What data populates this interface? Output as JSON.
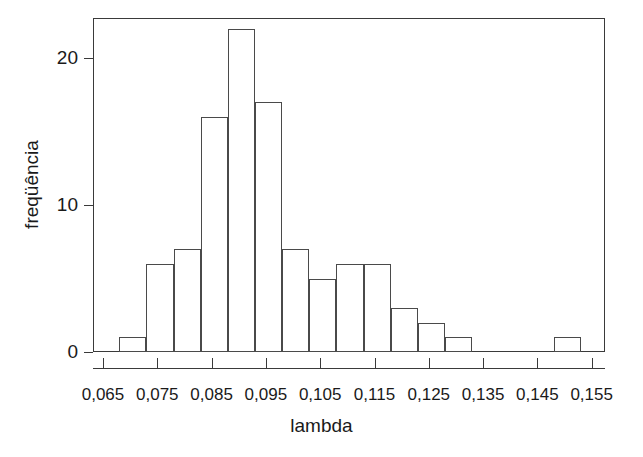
{
  "chart_data": {
    "type": "bar",
    "title": "",
    "subtitle": "",
    "xlabel": "lambda",
    "ylabel": "freqüência",
    "xlim": [
      0.065,
      0.155
    ],
    "ylim": [
      0,
      22
    ],
    "grid": false,
    "legend": "none",
    "bin_width": 0.005,
    "x_tick_labels": [
      "0,065",
      "0,075",
      "0,085",
      "0,095",
      "0,105",
      "0,115",
      "0,125",
      "0,135",
      "0,145",
      "0,155"
    ],
    "x_tick_values": [
      0.065,
      0.075,
      0.085,
      0.095,
      0.105,
      0.115,
      0.125,
      0.135,
      0.145,
      0.155
    ],
    "y_tick_labels": [
      "0",
      "10",
      "20"
    ],
    "y_tick_values": [
      0,
      10,
      20
    ],
    "categories": [
      "0,068-0,073",
      "0,073-0,078",
      "0,078-0,083",
      "0,083-0,088",
      "0,088-0,093",
      "0,093-0,098",
      "0,098-0,103",
      "0,103-0,108",
      "0,108-0,113",
      "0,113-0,118",
      "0,118-0,123",
      "0,123-0,128",
      "0,128-0,133",
      "0,148-0,153"
    ],
    "values": [
      1,
      6,
      7,
      16,
      22,
      17,
      7,
      5,
      6,
      6,
      3,
      2,
      1,
      1
    ],
    "bins": [
      {
        "x0": 0.068,
        "x1": 0.073,
        "count": 1
      },
      {
        "x0": 0.073,
        "x1": 0.078,
        "count": 6
      },
      {
        "x0": 0.078,
        "x1": 0.083,
        "count": 7
      },
      {
        "x0": 0.083,
        "x1": 0.088,
        "count": 16
      },
      {
        "x0": 0.088,
        "x1": 0.093,
        "count": 22
      },
      {
        "x0": 0.093,
        "x1": 0.098,
        "count": 17
      },
      {
        "x0": 0.098,
        "x1": 0.103,
        "count": 7
      },
      {
        "x0": 0.103,
        "x1": 0.108,
        "count": 5
      },
      {
        "x0": 0.108,
        "x1": 0.113,
        "count": 6
      },
      {
        "x0": 0.113,
        "x1": 0.118,
        "count": 6
      },
      {
        "x0": 0.118,
        "x1": 0.123,
        "count": 3
      },
      {
        "x0": 0.123,
        "x1": 0.128,
        "count": 2
      },
      {
        "x0": 0.128,
        "x1": 0.133,
        "count": 1
      },
      {
        "x0": 0.148,
        "x1": 0.153,
        "count": 1
      }
    ],
    "colors": {
      "bar_fill": "#ffffff",
      "bar_stroke": "#4a4a4a",
      "axis": "#3a3a3a",
      "text": "#1a1a1a",
      "background": "#ffffff"
    }
  }
}
